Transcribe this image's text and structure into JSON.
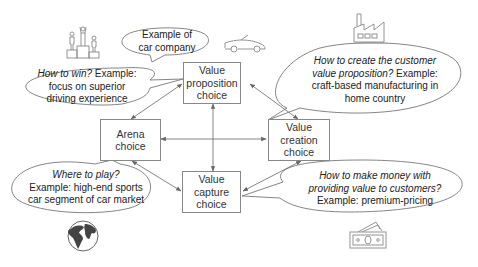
{
  "diagram": {
    "title": "",
    "boxes": {
      "value_proposition": {
        "line1": "Value",
        "line2": "proposition",
        "line3": "choice"
      },
      "arena": {
        "line1": "Arena",
        "line2": "choice"
      },
      "value_creation": {
        "line1": "Value",
        "line2": "creation",
        "line3": "choice"
      },
      "value_capture": {
        "line1": "Value",
        "line2": "capture",
        "line3": "choice"
      }
    },
    "bubbles": {
      "company_example": {
        "line1": "Example of",
        "line2": "car company"
      },
      "how_to_win": {
        "question": "How to win?",
        "line1_rest": " Example:",
        "line2": "focus on superior",
        "line3": "driving experience"
      },
      "how_to_create": {
        "line1": "How to create the customer",
        "line2_q": "value proposition?",
        "line2_rest": " Example:",
        "line3": "craft-based manufacturing in",
        "line4": "home country"
      },
      "where_to_play": {
        "question": "Where to play?",
        "line2": "Example: high-end sports",
        "line3": "car segment of car market"
      },
      "how_to_make_money": {
        "line1": "How to make money with",
        "line2": "providing value to customers?",
        "line3": "Example: premium-pricing"
      }
    },
    "icons": {
      "podium": "podium-icon",
      "car": "car-icon",
      "factory": "factory-icon",
      "globe": "globe-icon",
      "money": "money-icon"
    },
    "connections": [
      {
        "from": "value_proposition",
        "to": "arena",
        "type": "bidirectional"
      },
      {
        "from": "value_proposition",
        "to": "value_creation",
        "type": "bidirectional"
      },
      {
        "from": "value_proposition",
        "to": "value_capture",
        "type": "bidirectional"
      },
      {
        "from": "arena",
        "to": "value_creation",
        "type": "bidirectional"
      },
      {
        "from": "arena",
        "to": "value_capture",
        "type": "bidirectional"
      },
      {
        "from": "value_creation",
        "to": "value_capture",
        "type": "bidirectional"
      }
    ],
    "colors": {
      "line": "#777777",
      "box_border": "#888888",
      "text": "#222222"
    }
  }
}
